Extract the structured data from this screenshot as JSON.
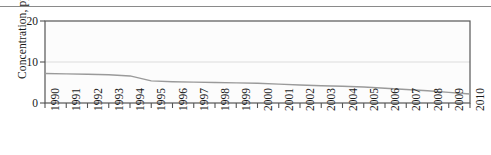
{
  "figure": {
    "top_rule": true,
    "background": "#ffffff"
  },
  "chart_data": {
    "type": "line",
    "title": "",
    "xlabel": "",
    "ylabel": "Concentration, ppb",
    "xlim": [
      1990,
      2010
    ],
    "ylim": [
      0,
      20
    ],
    "yticks": [
      0,
      10,
      20
    ],
    "ytick_labels": [
      "0",
      "10",
      "20"
    ],
    "grid": "horizontal-at-10",
    "legend": "none",
    "line_color": "#9a9a9a",
    "frame_color": "#555555",
    "gridline_color": "#d9d9d9",
    "x": [
      1990,
      1991,
      1992,
      1993,
      1994,
      1995,
      1996,
      1997,
      1998,
      1999,
      2000,
      2001,
      2002,
      2003,
      2004,
      2005,
      2006,
      2007,
      2008,
      2009,
      2010
    ],
    "xtick_labels": [
      "1990",
      "1991",
      "1992",
      "1993",
      "1994",
      "1995",
      "1996",
      "1997",
      "1998",
      "1999",
      "2000",
      "2001",
      "2002",
      "2003",
      "2004",
      "2005",
      "2006",
      "2007",
      "2008",
      "2009",
      "2010"
    ],
    "values": [
      7.2,
      7.1,
      7.0,
      6.9,
      6.6,
      5.4,
      5.2,
      5.1,
      5.0,
      4.9,
      4.8,
      4.6,
      4.4,
      4.2,
      4.1,
      3.9,
      3.6,
      3.3,
      3.0,
      2.6,
      2.2
    ],
    "series": [
      {
        "name": "Concentration",
        "values": [
          7.2,
          7.1,
          7.0,
          6.9,
          6.6,
          5.4,
          5.2,
          5.1,
          5.0,
          4.9,
          4.8,
          4.6,
          4.4,
          4.2,
          4.1,
          3.9,
          3.6,
          3.3,
          3.0,
          2.6,
          2.2
        ]
      }
    ]
  }
}
